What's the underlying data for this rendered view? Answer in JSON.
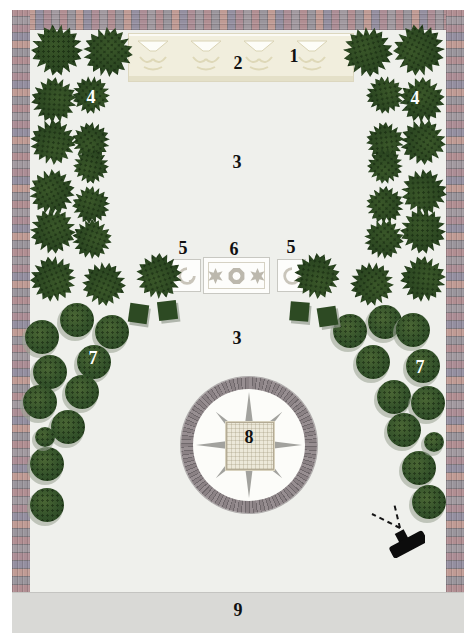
{
  "plan": {
    "area_labels": [
      {
        "text": "1",
        "x": 294,
        "y": 56,
        "color": "#111111"
      },
      {
        "text": "2",
        "x": 238,
        "y": 63,
        "color": "#111111"
      },
      {
        "text": "3",
        "x": 237,
        "y": 162,
        "color": "#111111"
      },
      {
        "text": "4",
        "x": 91,
        "y": 97,
        "color": "#ffffff"
      },
      {
        "text": "4",
        "x": 415,
        "y": 98,
        "color": "#ffffff"
      },
      {
        "text": "5",
        "x": 183,
        "y": 248,
        "color": "#111111"
      },
      {
        "text": "6",
        "x": 234,
        "y": 249,
        "color": "#111111"
      },
      {
        "text": "5",
        "x": 291,
        "y": 247,
        "color": "#111111"
      },
      {
        "text": "3",
        "x": 237,
        "y": 338,
        "color": "#111111"
      },
      {
        "text": "7",
        "x": 93,
        "y": 358,
        "color": "#ffffff"
      },
      {
        "text": "7",
        "x": 420,
        "y": 367,
        "color": "#ffffff"
      },
      {
        "text": "8",
        "x": 249,
        "y": 437,
        "color": "#111111"
      },
      {
        "text": "9",
        "x": 238,
        "y": 610,
        "color": "#111111"
      }
    ],
    "features": {
      "conifer_trees": [
        [
          57,
          50,
          52
        ],
        [
          108,
          52,
          50
        ],
        [
          54,
          100,
          46
        ],
        [
          91,
          95,
          38
        ],
        [
          53,
          142,
          46
        ],
        [
          91,
          141,
          38
        ],
        [
          91,
          166,
          36
        ],
        [
          52,
          192,
          46
        ],
        [
          91,
          205,
          38
        ],
        [
          53,
          231,
          46
        ],
        [
          92,
          239,
          40
        ],
        [
          53,
          279,
          46
        ],
        [
          104,
          284,
          44
        ],
        [
          159,
          276,
          46
        ],
        [
          419,
          50,
          52
        ],
        [
          368,
          52,
          50
        ],
        [
          422,
          100,
          46
        ],
        [
          385,
          95,
          38
        ],
        [
          423,
          142,
          46
        ],
        [
          385,
          141,
          38
        ],
        [
          385,
          166,
          36
        ],
        [
          424,
          192,
          46
        ],
        [
          385,
          205,
          38
        ],
        [
          423,
          231,
          46
        ],
        [
          384,
          239,
          40
        ],
        [
          423,
          279,
          46
        ],
        [
          372,
          284,
          44
        ],
        [
          317,
          276,
          46
        ]
      ],
      "round_trees": [
        [
          77,
          320
        ],
        [
          112,
          332
        ],
        [
          42,
          337
        ],
        [
          94,
          362
        ],
        [
          50,
          372
        ],
        [
          82,
          392
        ],
        [
          40,
          402
        ],
        [
          68,
          427
        ],
        [
          47,
          464
        ],
        [
          47,
          505
        ],
        [
          385,
          322
        ],
        [
          350,
          331
        ],
        [
          413,
          330
        ],
        [
          373,
          362
        ],
        [
          423,
          366
        ],
        [
          394,
          397
        ],
        [
          428,
          403
        ],
        [
          404,
          430
        ],
        [
          419,
          468
        ],
        [
          429,
          502
        ]
      ],
      "small_round_trees": [
        [
          45,
          437
        ],
        [
          434,
          442
        ]
      ],
      "square_shrubs": [
        [
          139,
          314
        ],
        [
          168,
          311
        ],
        [
          300,
          312
        ],
        [
          328,
          317
        ]
      ]
    },
    "colors": {
      "paver_red": "#b18e92",
      "paver_gray": "#9a959c",
      "paver_rose": "#c09b94",
      "paver_purple": "#948fa0",
      "conifer_green": "#2b4621",
      "shrub_green": "#2d4a23",
      "plaza_light": "#eff0ec",
      "pavilion_cream": "#f1eedd",
      "road_gray": "#d9d9d6",
      "ring_mauve": "#8b8285",
      "marker_black": "#141414"
    }
  }
}
